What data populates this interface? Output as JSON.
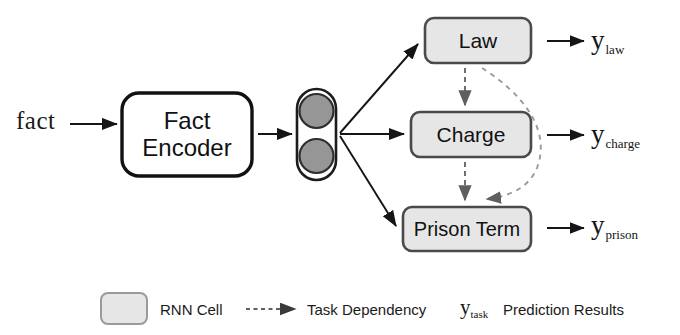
{
  "figure": {
    "input_label": "fact",
    "encoder_label_line1": "Fact",
    "encoder_label_line2": "Encoder"
  },
  "colors": {
    "rnn_cell_fill": "#e6e6e6",
    "rnn_cell_border": "#4a4a4a",
    "encoder_border": "#111111",
    "encoder_fill": "#ffffff",
    "circle_fill": "#9a9a9a",
    "circle_border": "#3a3a3a",
    "arrow_solid": "#151515",
    "arrow_dashed": "#6e6e6e",
    "text": "#151515",
    "background": "#ffffff"
  },
  "task_boxes": [
    {
      "id": "law",
      "label": "Law",
      "x": 425,
      "y": 18,
      "w": 106,
      "h": 45
    },
    {
      "id": "charge",
      "label": "Charge",
      "x": 411,
      "y": 112,
      "w": 120,
      "h": 45
    },
    {
      "id": "prison",
      "label": "Prison Term",
      "x": 403,
      "y": 207,
      "w": 128,
      "h": 44
    }
  ],
  "predictions": [
    {
      "id": "law",
      "base": "y",
      "subscript": "law"
    },
    {
      "id": "charge",
      "base": "y",
      "subscript": "charge"
    },
    {
      "id": "prison",
      "base": "y",
      "subscript": "prison"
    }
  ],
  "edges": {
    "solid": [
      {
        "from": "fact",
        "to": "fact-encoder"
      },
      {
        "from": "fact-encoder",
        "to": "rnn-cell"
      },
      {
        "from": "rnn-cell",
        "to": "law"
      },
      {
        "from": "rnn-cell",
        "to": "charge"
      },
      {
        "from": "rnn-cell",
        "to": "prison"
      },
      {
        "from": "law",
        "to": "y-law"
      },
      {
        "from": "charge",
        "to": "y-charge"
      },
      {
        "from": "prison",
        "to": "y-prison"
      }
    ],
    "dashed": [
      {
        "from": "law",
        "to": "charge",
        "style": "straight"
      },
      {
        "from": "charge",
        "to": "prison",
        "style": "straight"
      },
      {
        "from": "law",
        "to": "prison",
        "style": "curved"
      }
    ]
  },
  "legend": {
    "rnn_cell_label": "RNN Cell",
    "task_dependency_label": "Task Dependency",
    "prediction_symbol_base": "y",
    "prediction_symbol_subscript": "task",
    "prediction_results_label": "Prediction Results"
  }
}
